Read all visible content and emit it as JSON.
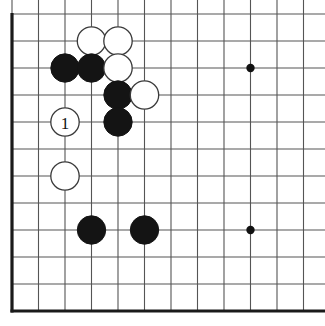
{
  "figure": {
    "kind": "go-board-diagram",
    "board_label": "",
    "artifact": "page-curl-mark"
  },
  "board": {
    "columns": 12,
    "rows": 12,
    "origin_x": 12,
    "origin_y": 14,
    "spacing_x": 26.5,
    "spacing_y": 27,
    "line_color": "#555555",
    "edge_color": "#1a1a1a",
    "edge_width": 3.2,
    "line_width": 1.1,
    "background": "#ffffff",
    "left_edge_is_board_border": true,
    "bottom_edge_is_board_border": true,
    "top_clipped": true,
    "right_clipped": true
  },
  "star_points": [
    {
      "col": 9,
      "row": 2,
      "name": "hoshi-upper-right"
    },
    {
      "col": 9,
      "row": 8,
      "name": "hoshi-lower-right"
    }
  ],
  "star_point_style": {
    "radius": 4.2,
    "color": "#111111"
  },
  "stone_style": {
    "radius": 14.2,
    "black_fill": "#141414",
    "black_stroke": "#141414",
    "white_fill": "#ffffff",
    "white_stroke": "#3a3a3a",
    "white_stroke_width": 1.3
  },
  "stones": [
    {
      "color": "white",
      "col": 3,
      "row": 1,
      "label": "",
      "name": "white-stone-d11"
    },
    {
      "color": "white",
      "col": 4,
      "row": 1,
      "label": "",
      "name": "white-stone-e11"
    },
    {
      "color": "black",
      "col": 2,
      "row": 2,
      "label": "",
      "name": "black-stone-c10"
    },
    {
      "color": "black",
      "col": 3,
      "row": 2,
      "label": "",
      "name": "black-stone-d10"
    },
    {
      "color": "white",
      "col": 4,
      "row": 2,
      "label": "",
      "name": "white-stone-e10"
    },
    {
      "color": "black",
      "col": 4,
      "row": 3,
      "label": "",
      "name": "black-stone-e9"
    },
    {
      "color": "white",
      "col": 5,
      "row": 3,
      "label": "",
      "name": "white-stone-f9"
    },
    {
      "color": "black",
      "col": 4,
      "row": 4,
      "label": "",
      "name": "black-stone-e8"
    },
    {
      "color": "white",
      "col": 2,
      "row": 4,
      "label": "1",
      "name": "white-stone-move-1"
    },
    {
      "color": "white",
      "col": 2,
      "row": 6,
      "label": "",
      "name": "white-stone-c6"
    },
    {
      "color": "black",
      "col": 3,
      "row": 8,
      "label": "",
      "name": "black-stone-d4"
    },
    {
      "color": "black",
      "col": 5,
      "row": 8,
      "label": "",
      "name": "black-stone-f4"
    }
  ],
  "move_numbers": [
    {
      "number": "1",
      "stone": "white-stone-move-1"
    }
  ]
}
